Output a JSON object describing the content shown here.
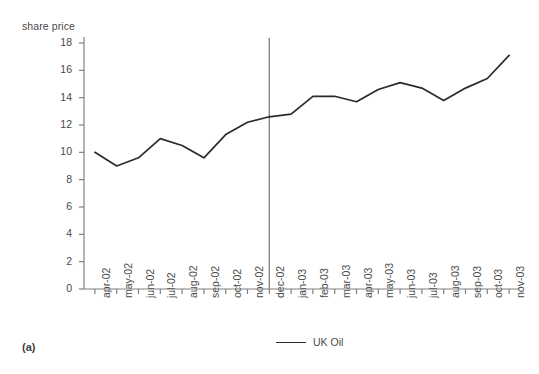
{
  "figure": {
    "caption": "(a)",
    "background": "#ffffff"
  },
  "legend": {
    "label": "UK Oil",
    "color": "#2b2b2b",
    "position": "bottom-center"
  },
  "axes": {
    "y_title": "share price",
    "y_ticks": [
      "0",
      "2",
      "4",
      "6",
      "8",
      "10",
      "12",
      "14",
      "16",
      "18"
    ],
    "x_ticks": [
      "apr-02",
      "may-02",
      "jun-02",
      "jul-02",
      "aug-02",
      "sep-02",
      "oct-02",
      "nov-02",
      "dec-02",
      "jan-03",
      "feb-03",
      "mar-03",
      "apr-03",
      "may-03",
      "jun-03",
      "jul-03",
      "aug-03",
      "sep-03",
      "oct-03",
      "nov-03"
    ]
  },
  "annotations": {
    "vertical_divider_at": "dec-02"
  },
  "chart_data": {
    "type": "line",
    "title": "",
    "xlabel": "",
    "ylabel": "share price",
    "ylim": [
      0,
      18
    ],
    "grid": false,
    "legend_position": "bottom-center",
    "categories": [
      "apr-02",
      "may-02",
      "jun-02",
      "jul-02",
      "aug-02",
      "sep-02",
      "oct-02",
      "nov-02",
      "dec-02",
      "jan-03",
      "feb-03",
      "mar-03",
      "apr-03",
      "may-03",
      "jun-03",
      "jul-03",
      "aug-03",
      "sep-03",
      "oct-03",
      "nov-03"
    ],
    "series": [
      {
        "name": "UK Oil",
        "color": "#2b2b2b",
        "values": [
          10.0,
          9.0,
          9.6,
          11.0,
          10.5,
          9.6,
          11.3,
          12.2,
          12.6,
          12.8,
          14.1,
          14.1,
          13.7,
          14.6,
          15.1,
          14.7,
          13.8,
          14.7,
          15.4,
          17.1
        ]
      }
    ],
    "annotations": [
      {
        "type": "vline",
        "at_category": "dec-02",
        "color": "#7a7a7a"
      }
    ]
  }
}
